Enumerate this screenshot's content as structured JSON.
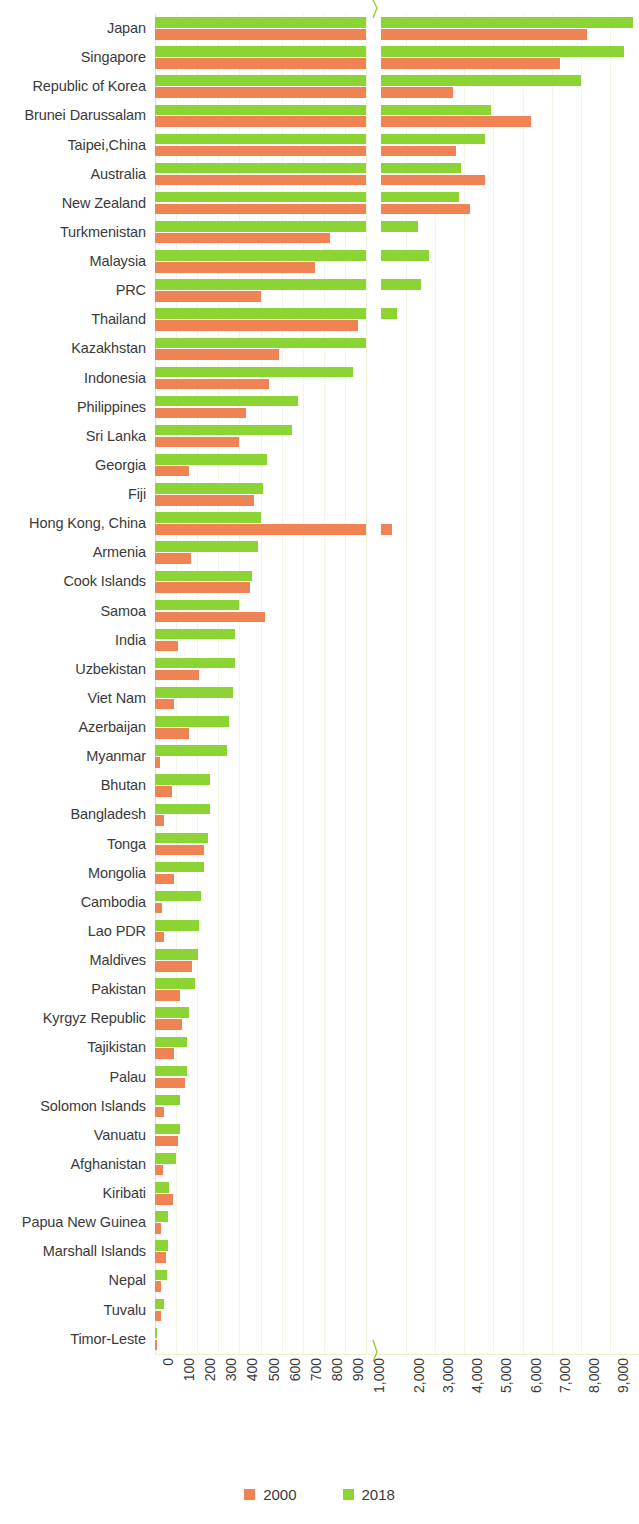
{
  "chart_data": {
    "type": "bar",
    "orientation": "horizontal",
    "title": "",
    "subtitle": "",
    "xlabel": "",
    "ylabel": "",
    "grid": true,
    "legend_position": "bottom",
    "broken_axis": true,
    "axis_break_after": 1000,
    "xlim_lower": [
      0,
      1000
    ],
    "xlim_upper": [
      1000,
      10000
    ],
    "xticks": [
      "0",
      "100",
      "200",
      "300",
      "400",
      "500",
      "600",
      "700",
      "800",
      "900",
      "1,000",
      "2,000",
      "3,000",
      "4,000",
      "5,000",
      "6,000",
      "7,000",
      "8,000",
      "9,000",
      "10,000"
    ],
    "colors": {
      "series_2000": "#ef8354",
      "series_2018": "#8cd433"
    },
    "categories": [
      "Japan",
      "Singapore",
      "Republic of Korea",
      "Brunei Darussalam",
      "Taipei,China",
      "Australia",
      "New Zealand",
      "Turkmenistan",
      "Malaysia",
      "PRC",
      "Thailand",
      "Kazakhstan",
      "Indonesia",
      "Philippines",
      "Sri Lanka",
      "Georgia",
      "Fiji",
      "Hong Kong, China",
      "Armenia",
      "Cook Islands",
      "Samoa",
      "India",
      "Uzbekistan",
      "Viet Nam",
      "Azerbaijan",
      "Myanmar",
      "Bhutan",
      "Bangladesh",
      "Tonga",
      "Mongolia",
      "Cambodia",
      "Lao PDR",
      "Maldives",
      "Pakistan",
      "Kyrgyz Republic",
      "Tajikistan",
      "Palau",
      "Solomon Islands",
      "Vanuatu",
      "Afghanistan",
      "Kiribati",
      "Papua New Guinea",
      "Marshall Islands",
      "Nepal",
      "Tuvalu",
      "Timor-Leste"
    ],
    "series": [
      {
        "name": "2000",
        "color": "#ef8354",
        "values": [
          8200,
          7300,
          3600,
          6300,
          3700,
          4700,
          4200,
          830,
          760,
          500,
          960,
          590,
          540,
          430,
          400,
          160,
          470,
          1530,
          170,
          450,
          520,
          110,
          210,
          90,
          160,
          25,
          80,
          45,
          230,
          90,
          35,
          45,
          175,
          120,
          130,
          90,
          140,
          45,
          110,
          40,
          85,
          30,
          50,
          30,
          30,
          10
        ]
      },
      {
        "name": "2018",
        "color": "#8cd433",
        "values": [
          9800,
          9500,
          8000,
          4900,
          4700,
          3900,
          3800,
          2400,
          2800,
          2500,
          1700,
          1020,
          940,
          680,
          650,
          530,
          510,
          500,
          490,
          460,
          400,
          380,
          380,
          370,
          350,
          340,
          260,
          260,
          250,
          230,
          220,
          210,
          205,
          190,
          160,
          150,
          150,
          120,
          120,
          100,
          65,
          60,
          60,
          55,
          45,
          8
        ]
      }
    ]
  },
  "legend": {
    "items": [
      {
        "label": "2000",
        "color": "#ef8354"
      },
      {
        "label": "2018",
        "color": "#8cd433"
      }
    ]
  }
}
